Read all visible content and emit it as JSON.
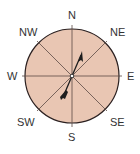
{
  "diagram": {
    "type": "compass-rose",
    "colors": {
      "fill": "#e9c6b3",
      "outline": "#2b2020",
      "lines": "#5a4a44",
      "needle": "#1e1e1e",
      "label": "#333333"
    },
    "labels": {
      "n": "N",
      "ne": "NE",
      "e": "E",
      "se": "SE",
      "s": "S",
      "sw": "SW",
      "w": "W",
      "nw": "NW"
    },
    "needle": {
      "pointing": "NNE"
    }
  }
}
